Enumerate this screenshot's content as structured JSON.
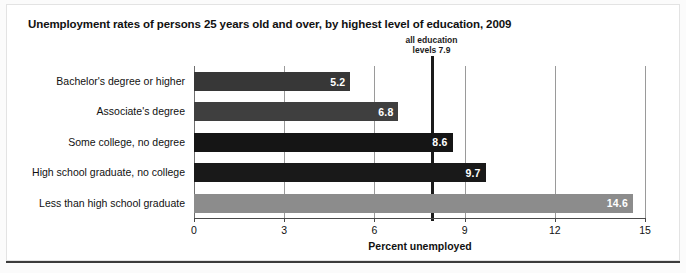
{
  "chart_data": {
    "type": "bar",
    "orientation": "horizontal",
    "title": "Unemployment rates of persons 25 years old and over, by highest level of education, 2009",
    "xlabel": "Percent unemployed",
    "ylabel": "",
    "xlim": [
      0,
      15
    ],
    "xticks": [
      "0",
      "3",
      "6",
      "9",
      "12",
      "15"
    ],
    "xtick_values": [
      0,
      3,
      6,
      9,
      12,
      15
    ],
    "grid": "vertical",
    "legend": "none",
    "categories": [
      "Bachelor's degree or higher",
      "Associate's degree",
      "Some college, no degree",
      "High school graduate, no college",
      "Less than high school graduate"
    ],
    "values": [
      5.2,
      6.8,
      8.6,
      9.7,
      14.6
    ],
    "value_labels": [
      "5.2",
      "6.8",
      "8.6",
      "9.7",
      "14.6"
    ],
    "bar_colors": [
      "#373737",
      "#3f3f3f",
      "#151515",
      "#191919",
      "#8c8c8c"
    ],
    "annotations": [
      {
        "name": "all-education-levels-reference",
        "text_line1": "all education",
        "text_line2": "levels 7.9",
        "value": 7.9,
        "color": "#1b1b1b"
      }
    ]
  },
  "colors": {
    "background": "#ffffff",
    "text": "#111111",
    "gridline": "#9a9a9a",
    "axis": "#4a4a4a",
    "reference_line": "#1b1b1b"
  }
}
